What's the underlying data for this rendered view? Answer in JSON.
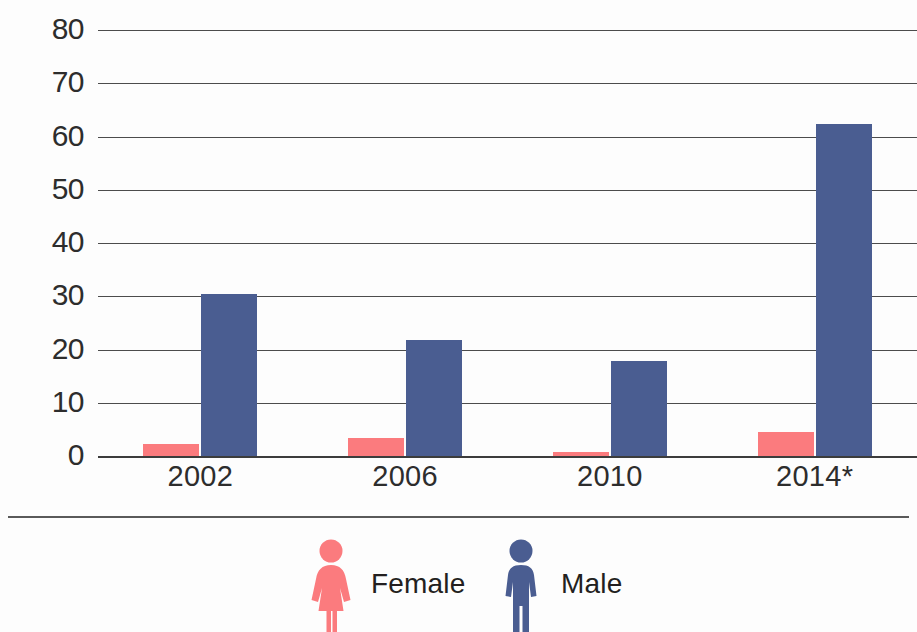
{
  "chart_data": {
    "type": "bar",
    "title": "",
    "xlabel": "",
    "ylabel": "",
    "categories": [
      "2002",
      "2006",
      "2010",
      "2014*"
    ],
    "series": [
      {
        "name": "Female",
        "color": "#fb7b7e",
        "values": [
          2.2,
          3.4,
          0.7,
          4.6
        ]
      },
      {
        "name": "Male",
        "color": "#4a5d91",
        "values": [
          30.5,
          21.8,
          17.9,
          62.3
        ]
      }
    ],
    "ylim": [
      0,
      80
    ],
    "ytick_labels": [
      "80",
      "70",
      "60",
      "50",
      "40",
      "30",
      "20",
      "10",
      "0"
    ],
    "ytick_values": [
      80,
      70,
      60,
      50,
      40,
      30,
      20,
      10,
      0
    ],
    "grid": true,
    "grid_axis": "y",
    "legend_position": "bottom",
    "legend": [
      {
        "label": "Female",
        "icon": "female-figure-icon",
        "color": "#fb7b7e"
      },
      {
        "label": "Male",
        "icon": "male-figure-icon",
        "color": "#4a5d91"
      }
    ],
    "footnote_marker": "*"
  },
  "axis": {
    "gridline_color": "#4c4c4c",
    "baseline_color": "#3c3c3c",
    "rule_color": "#5a5a5a"
  }
}
